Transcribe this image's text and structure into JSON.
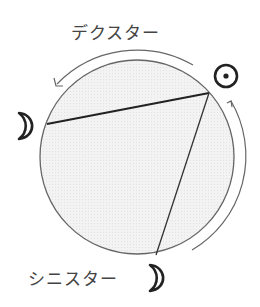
{
  "labels": {
    "dexter": "デクスター",
    "sinister": "シニスター"
  },
  "symbols": {
    "sun": "sun-symbol",
    "moon_left": "moon-symbol",
    "moon_bottom": "moon-symbol"
  },
  "colors": {
    "circle_fill": "#f2f2f2",
    "stroke": "#555555",
    "symbol": "#222222"
  }
}
